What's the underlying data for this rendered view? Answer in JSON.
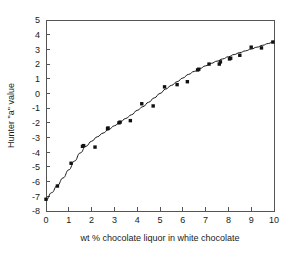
{
  "chart_data": {
    "type": "scatter",
    "title": "",
    "subtitle": "",
    "xlabel": "wt % chocolate liquor in white chocolate",
    "ylabel": "Hunter \"a\" value",
    "xlim": [
      0,
      10
    ],
    "ylim": [
      -8,
      5
    ],
    "xticks": [
      0,
      1,
      2,
      3,
      4,
      5,
      6,
      7,
      8,
      9,
      10
    ],
    "yticks": [
      -8,
      -7,
      -6,
      -5,
      -4,
      -3,
      -2,
      -1,
      0,
      1,
      2,
      3,
      4,
      5
    ],
    "xtick_labels": [
      "0",
      "1",
      "2",
      "3",
      "4",
      "5",
      "6",
      "7",
      "8",
      "9",
      "10"
    ],
    "ytick_labels": [
      "-8",
      "-7",
      "-6",
      "-5",
      "-4",
      "-3",
      "-2",
      "-1",
      "0",
      "1",
      "2",
      "3",
      "4",
      "5"
    ],
    "grid": false,
    "legend": null,
    "legend_position": "none",
    "marker_style": "filled-square",
    "marker_color": "#111111",
    "curve_color": "#1a1a1a",
    "axis_color": "#555555",
    "background_color": "#ffffff",
    "series": [
      {
        "name": "Hunter a value measurements",
        "points": [
          [
            0.0,
            -7.2
          ],
          [
            0.5,
            -6.3
          ],
          [
            1.1,
            -4.75
          ],
          [
            1.6,
            -3.6
          ],
          [
            1.65,
            -3.55
          ],
          [
            2.15,
            -3.65
          ],
          [
            2.7,
            -2.4
          ],
          [
            2.72,
            -2.35
          ],
          [
            3.2,
            -2.0
          ],
          [
            3.25,
            -1.95
          ],
          [
            3.7,
            -1.85
          ],
          [
            4.2,
            -0.7
          ],
          [
            4.7,
            -0.85
          ],
          [
            5.2,
            0.45
          ],
          [
            5.75,
            0.6
          ],
          [
            6.2,
            0.8
          ],
          [
            6.65,
            1.6
          ],
          [
            6.7,
            1.65
          ],
          [
            7.15,
            2.0
          ],
          [
            7.6,
            2.0
          ],
          [
            7.65,
            2.15
          ],
          [
            8.05,
            2.35
          ],
          [
            8.1,
            2.4
          ],
          [
            8.5,
            2.6
          ],
          [
            9.0,
            3.15
          ],
          [
            9.45,
            3.1
          ],
          [
            9.95,
            3.5
          ]
        ]
      }
    ],
    "fit_curve": {
      "name": "fitted trend curve",
      "points": [
        [
          0.0,
          -7.25
        ],
        [
          0.25,
          -6.75
        ],
        [
          0.5,
          -6.25
        ],
        [
          0.75,
          -5.75
        ],
        [
          1.0,
          -5.2
        ],
        [
          1.25,
          -4.6
        ],
        [
          1.5,
          -4.05
        ],
        [
          1.75,
          -3.6
        ],
        [
          2.0,
          -3.25
        ],
        [
          2.25,
          -2.95
        ],
        [
          2.5,
          -2.7
        ],
        [
          2.75,
          -2.45
        ],
        [
          3.0,
          -2.2
        ],
        [
          3.25,
          -1.95
        ],
        [
          3.5,
          -1.7
        ],
        [
          3.75,
          -1.45
        ],
        [
          4.0,
          -1.15
        ],
        [
          4.25,
          -0.9
        ],
        [
          4.5,
          -0.6
        ],
        [
          4.75,
          -0.3
        ],
        [
          5.0,
          0.0
        ],
        [
          5.25,
          0.3
        ],
        [
          5.5,
          0.55
        ],
        [
          5.75,
          0.8
        ],
        [
          6.0,
          1.05
        ],
        [
          6.25,
          1.3
        ],
        [
          6.5,
          1.5
        ],
        [
          6.75,
          1.7
        ],
        [
          7.0,
          1.88
        ],
        [
          7.25,
          2.05
        ],
        [
          7.5,
          2.2
        ],
        [
          7.75,
          2.35
        ],
        [
          8.0,
          2.5
        ],
        [
          8.25,
          2.65
        ],
        [
          8.5,
          2.78
        ],
        [
          8.75,
          2.9
        ],
        [
          9.0,
          3.02
        ],
        [
          9.25,
          3.15
        ],
        [
          9.5,
          3.28
        ],
        [
          9.75,
          3.4
        ],
        [
          10.0,
          3.55
        ]
      ]
    }
  }
}
